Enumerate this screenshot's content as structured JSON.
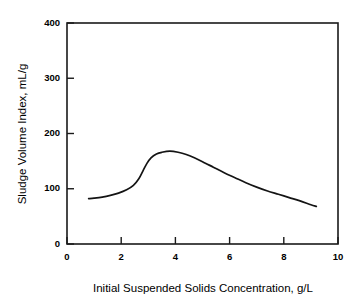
{
  "chart_data": {
    "type": "line",
    "title": "",
    "xlabel": "Initial Suspended Solids Concentration, g/L",
    "ylabel": "Sludge Volume Index, mL/g",
    "xlim": [
      0,
      10
    ],
    "ylim": [
      0,
      400
    ],
    "xticks": [
      0,
      2,
      4,
      6,
      8,
      10
    ],
    "yticks": [
      0,
      100,
      200,
      300,
      400
    ],
    "xtick_labels": [
      "0",
      "2",
      "4",
      "6",
      "8",
      "10"
    ],
    "ytick_labels": [
      "0",
      "100",
      "200",
      "300",
      "400"
    ],
    "grid": false,
    "legend": false,
    "series": [
      {
        "name": "Sludge Volume Index",
        "color": "#141414",
        "x": [
          0.8,
          1.0,
          1.3,
          1.6,
          1.9,
          2.2,
          2.45,
          2.65,
          2.8,
          2.95,
          3.1,
          3.3,
          3.5,
          3.8,
          4.1,
          4.4,
          4.7,
          5.0,
          5.4,
          5.8,
          6.2,
          6.6,
          7.0,
          7.4,
          7.8,
          8.2,
          8.6,
          9.0,
          9.2
        ],
        "y": [
          82,
          83,
          85,
          88,
          92,
          98,
          106,
          118,
          132,
          146,
          156,
          163,
          166,
          168,
          166,
          162,
          156,
          149,
          139,
          129,
          120,
          111,
          103,
          96,
          90,
          84,
          78,
          71,
          68
        ]
      }
    ]
  },
  "axes": {
    "y_title": "Sludge Volume Index, mL/g",
    "x_title": "Initial Suspended Solids Concentration, g/L"
  },
  "labels": {
    "y0": "0",
    "y100": "100",
    "y200": "200",
    "y300": "300",
    "y400": "400",
    "x0": "0",
    "x2": "2",
    "x4": "4",
    "x6": "6",
    "x8": "8",
    "x10": "10"
  },
  "colors": {
    "background": "#ffffff",
    "axis": "#1a1a1a",
    "curve": "#141414",
    "text": "#000000"
  }
}
